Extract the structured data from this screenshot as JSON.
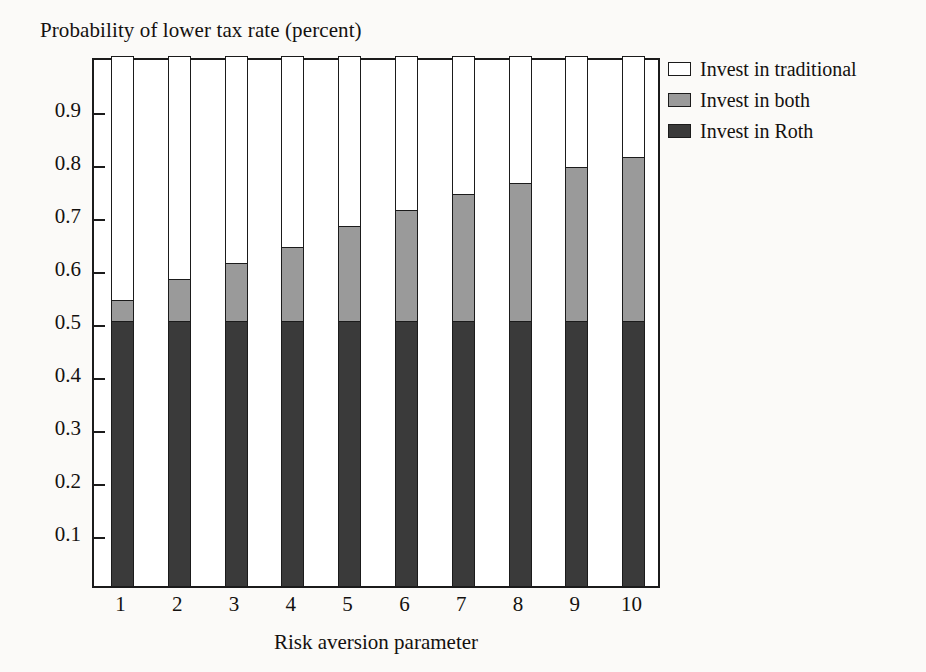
{
  "chart_data": {
    "type": "bar",
    "subtype": "stacked-bar",
    "title": "Probability of lower tax rate (percent)",
    "xlabel": "Risk aversion parameter",
    "ylabel": "",
    "categories": [
      "1",
      "2",
      "3",
      "4",
      "5",
      "6",
      "7",
      "8",
      "9",
      "10"
    ],
    "ylim": [
      0,
      1
    ],
    "ytick_labels": [
      "0.1",
      "0.2",
      "0.3",
      "0.4",
      "0.5",
      "0.6",
      "0.7",
      "0.8",
      "0.9"
    ],
    "ytick_values": [
      0.1,
      0.2,
      0.3,
      0.4,
      0.5,
      0.6,
      0.7,
      0.8,
      0.9
    ],
    "grid": false,
    "legend_position": "right",
    "stack_order_bottom_to_top": [
      "Invest in Roth",
      "Invest in both",
      "Invest in traditional"
    ],
    "series": [
      {
        "name": "Invest in Roth",
        "color": "#3a3a3a",
        "values": [
          0.5,
          0.5,
          0.5,
          0.5,
          0.5,
          0.5,
          0.5,
          0.5,
          0.5,
          0.5
        ]
      },
      {
        "name": "Invest in both",
        "color": "#9a9a9a",
        "values": [
          0.04,
          0.08,
          0.11,
          0.14,
          0.18,
          0.21,
          0.24,
          0.26,
          0.29,
          0.31
        ]
      },
      {
        "name": "Invest in traditional",
        "color": "#ffffff",
        "values": [
          0.46,
          0.42,
          0.39,
          0.36,
          0.32,
          0.29,
          0.26,
          0.24,
          0.21,
          0.19
        ]
      }
    ],
    "cumulative_tops": {
      "roth": [
        0.5,
        0.5,
        0.5,
        0.5,
        0.5,
        0.5,
        0.5,
        0.5,
        0.5,
        0.5
      ],
      "both": [
        0.54,
        0.58,
        0.61,
        0.64,
        0.68,
        0.71,
        0.74,
        0.76,
        0.79,
        0.81
      ],
      "traditional": [
        1.0,
        1.0,
        1.0,
        1.0,
        1.0,
        1.0,
        1.0,
        1.0,
        1.0,
        1.0
      ]
    }
  },
  "legend": {
    "items": [
      {
        "label": "Invest in traditional",
        "color": "#ffffff"
      },
      {
        "label": "Invest in both",
        "color": "#9a9a9a"
      },
      {
        "label": "Invest in Roth",
        "color": "#3a3a3a"
      }
    ]
  }
}
